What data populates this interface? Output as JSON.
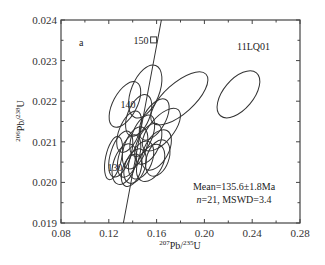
{
  "chart_data": {
    "type": "scatter",
    "subtype": "concordia-error-ellipses",
    "panel_label": "a",
    "sample_label": "11LQ01",
    "xlabel": "207Pb/235U",
    "ylabel": "206Pb/238U",
    "xlim": [
      0.08,
      0.28
    ],
    "ylim": [
      0.019,
      0.024
    ],
    "xticks": [
      "0.08",
      "0.12",
      "0.16",
      "0.20",
      "0.24",
      "0.28"
    ],
    "yticks": [
      "0.019",
      "0.020",
      "0.021",
      "0.022",
      "0.023",
      "0.024"
    ],
    "concordia_age_labels": [
      {
        "age": "150",
        "x": 0.1575,
        "y": 0.02351,
        "marker": "square"
      },
      {
        "age": "140",
        "x": 0.1465,
        "y": 0.02194
      },
      {
        "age": "130",
        "x": 0.1357,
        "y": 0.02037
      }
    ],
    "annotation": {
      "line1": "Mean=135.6±1.8Ma",
      "line2": "n=21, MSWD=3.4"
    },
    "ellipses": [
      {
        "x": 0.2285,
        "y": 0.02217,
        "rx_px": 15,
        "ry_px": 28,
        "rot": 40
      },
      {
        "x": 0.179,
        "y": 0.02207,
        "rx_px": 15,
        "ry_px": 36,
        "rot": 48
      },
      {
        "x": 0.1505,
        "y": 0.02224,
        "rx_px": 14,
        "ry_px": 28,
        "rot": 22
      },
      {
        "x": 0.1335,
        "y": 0.02192,
        "rx_px": 12,
        "ry_px": 25,
        "rot": 28
      },
      {
        "x": 0.145,
        "y": 0.02165,
        "rx_px": 11,
        "ry_px": 22,
        "rot": 22
      },
      {
        "x": 0.158,
        "y": 0.02155,
        "rx_px": 11,
        "ry_px": 23,
        "rot": 30
      },
      {
        "x": 0.164,
        "y": 0.0213,
        "rx_px": 12,
        "ry_px": 26,
        "rot": 40
      },
      {
        "x": 0.137,
        "y": 0.02125,
        "rx_px": 10,
        "ry_px": 22,
        "rot": 22
      },
      {
        "x": 0.148,
        "y": 0.02115,
        "rx_px": 10,
        "ry_px": 22,
        "rot": 22
      },
      {
        "x": 0.153,
        "y": 0.02095,
        "rx_px": 11,
        "ry_px": 22,
        "rot": 25
      },
      {
        "x": 0.142,
        "y": 0.02085,
        "rx_px": 11,
        "ry_px": 22,
        "rot": 20
      },
      {
        "x": 0.16,
        "y": 0.0208,
        "rx_px": 12,
        "ry_px": 22,
        "rot": 28
      },
      {
        "x": 0.13,
        "y": 0.0207,
        "rx_px": 10,
        "ry_px": 24,
        "rot": 18
      },
      {
        "x": 0.137,
        "y": 0.02065,
        "rx_px": 10,
        "ry_px": 22,
        "rot": 18
      },
      {
        "x": 0.147,
        "y": 0.02055,
        "rx_px": 11,
        "ry_px": 20,
        "rot": 22
      },
      {
        "x": 0.124,
        "y": 0.0206,
        "rx_px": 8,
        "ry_px": 22,
        "rot": 12
      },
      {
        "x": 0.155,
        "y": 0.02048,
        "rx_px": 12,
        "ry_px": 20,
        "rot": 28
      },
      {
        "x": 0.133,
        "y": 0.02045,
        "rx_px": 11,
        "ry_px": 21,
        "rot": 18
      },
      {
        "x": 0.142,
        "y": 0.0204,
        "rx_px": 10,
        "ry_px": 18,
        "rot": 20
      },
      {
        "x": 0.161,
        "y": 0.0206,
        "rx_px": 11,
        "ry_px": 19,
        "rot": 20
      },
      {
        "x": 0.139,
        "y": 0.0203,
        "rx_px": 9,
        "ry_px": 17,
        "rot": 20
      }
    ],
    "concordia_line": {
      "x": [
        0.1322,
        0.164
      ],
      "y": [
        0.019,
        0.024
      ]
    }
  }
}
